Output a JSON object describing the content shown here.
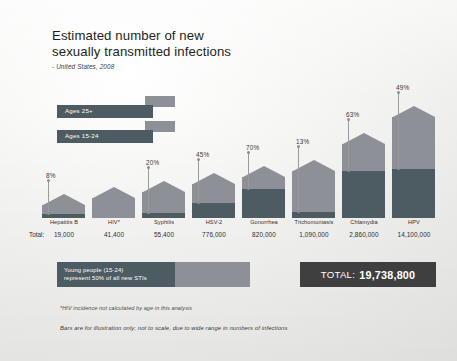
{
  "title": {
    "line1": "Estimated number of new",
    "line2": "sexually transmitted infections",
    "subtitle": "- United States, 2008"
  },
  "legend": {
    "items": [
      {
        "label": "Ages 25+",
        "color": "#8d9096"
      },
      {
        "label": "Ages 15-24",
        "color": "#4d5b63"
      }
    ]
  },
  "table": {
    "total_row_label": "Total:"
  },
  "young_people": {
    "line1": "Young people (15-24)",
    "line2": "represent 50% of all new STIs"
  },
  "total_box": {
    "label": "TOTAL:",
    "value": "19,738,800"
  },
  "footnotes": {
    "note1": "*HIV incidence not calculated by age in this analysis",
    "note2": "Bars are for illustration only; not to scale, due to wide range in numbers of infections"
  },
  "colors": {
    "ages_25_plus": "#8d9096",
    "ages_15_24": "#4d5b63",
    "total_box_bg": "#3f3f3f",
    "text": "#231f20",
    "background": "#f1f1ef"
  },
  "chart_data": {
    "type": "bar",
    "title": "Estimated number of new sexually transmitted infections",
    "subtitle": "- United States, 2008",
    "xlabel": "",
    "ylabel": "",
    "grid": false,
    "legend_position": "top-left",
    "note": "Stacked bars: lower segment = Ages 15-24 (percentage labeled), upper segment = Ages 25+. Bars are not to scale.",
    "categories": [
      "Hepatitis B",
      "HIV*",
      "Syphilis",
      "HSV-2",
      "Gonorrhea",
      "Trichomoniasis",
      "Chlamydia",
      "HPV"
    ],
    "totals": [
      "19,000",
      "41,400",
      "55,400",
      "776,000",
      "820,000",
      "1,090,000",
      "2,860,000",
      "14,100,000"
    ],
    "totals_numeric": [
      19000,
      41400,
      55400,
      776000,
      820000,
      1090000,
      2860000,
      14100000
    ],
    "youth_share_labels": [
      "8%",
      null,
      "20%",
      "45%",
      "70%",
      "13%",
      "63%",
      "49%"
    ],
    "youth_share_values": [
      8,
      null,
      20,
      45,
      70,
      13,
      63,
      49
    ],
    "series": [
      {
        "name": "Ages 15-24",
        "color": "#4d5b63",
        "values": [
          8,
          null,
          20,
          45,
          70,
          13,
          63,
          49
        ]
      },
      {
        "name": "Ages 25+",
        "color": "#8d9096",
        "values": [
          92,
          null,
          80,
          55,
          30,
          87,
          37,
          51
        ]
      }
    ],
    "bar_pixel_heights": [
      13,
      20,
      26,
      34,
      41,
      47,
      74,
      101
    ],
    "grand_total": "19,738,800"
  }
}
